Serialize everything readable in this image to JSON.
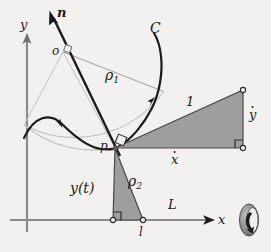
{
  "figure": {
    "kind": "geometry-diagram",
    "caption_labels": {
      "y_axis": "y",
      "x_axis": "x",
      "normal_vector": "n",
      "center_of_curvature": "o",
      "curve": "C",
      "radius_of_curvature_upper": "ρ",
      "radius_of_curvature_upper_sub": "1",
      "radius_of_curvature_lower": "ρ",
      "radius_of_curvature_lower_sub": "2",
      "contact_point": "p",
      "ground_point": "l",
      "unit_speed": "1",
      "y_dot": "y",
      "x_dot": "x",
      "height_function": "y(t)",
      "length": "L"
    },
    "colors": {
      "background": "#f2f1ef",
      "ink": "#1b1b1b",
      "axis_gray": "#8a8a8a",
      "light_gray": "#b9b9b9",
      "shade_fill": "#9e9e9e",
      "shade_stroke": "#4a4a4a",
      "wheel_dark": "#2b2b2b",
      "wheel_gray": "#8d8d8d"
    },
    "geometry": {
      "x_axis_y": 220,
      "y_axis_x": 27,
      "point_o": [
        63,
        52
      ],
      "point_p": [
        115,
        148
      ],
      "point_l": [
        143,
        220
      ],
      "point_foot": [
        113,
        220
      ],
      "triangle_top_right": [
        243,
        90
      ],
      "triangle_bottom_right": [
        243,
        148
      ],
      "normal_tip": [
        50,
        13
      ],
      "x_axis_tip": [
        213,
        220
      ],
      "y_axis_tip": [
        27,
        35
      ]
    },
    "icons": {
      "wheel": "rolling-wheel-icon",
      "x_arrow": "x-axis-arrowhead",
      "y_arrow": "y-axis-arrowhead",
      "n_arrow": "normal-arrowhead",
      "curve_arrow": "curve-direction-arrowhead"
    }
  }
}
